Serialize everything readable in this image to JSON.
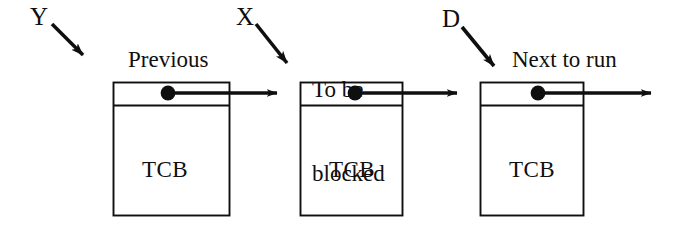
{
  "diagram": {
    "background_color": "#ffffff",
    "stroke_color": "#100f0f",
    "pointer_labels": [
      {
        "id": "y",
        "text": "Y",
        "x": 30,
        "y": 4,
        "arrow": {
          "x1": 52,
          "y1": 24,
          "x2": 90,
          "y2": 62
        }
      },
      {
        "id": "x",
        "text": "X",
        "x": 236,
        "y": 4,
        "arrow": {
          "x1": 256,
          "y1": 24,
          "x2": 293,
          "y2": 72
        }
      },
      {
        "id": "d",
        "text": "D",
        "x": 442,
        "y": 6,
        "arrow": {
          "x1": 462,
          "y1": 27,
          "x2": 500,
          "y2": 74
        }
      }
    ],
    "nodes": [
      {
        "id": "previous",
        "caption": "Previous",
        "caption_lines": [
          "Previous"
        ],
        "caption_x": 128,
        "caption_y": 48,
        "body_label": "TCB",
        "box": {
          "x": 113,
          "y": 82,
          "width": 117,
          "height": 134
        },
        "divider_y": 105,
        "dot": {
          "cx": 168,
          "cy": 93,
          "r": 7
        },
        "link_arrow": {
          "x1": 168,
          "y1": 93,
          "x2": 288,
          "y2": 93
        }
      },
      {
        "id": "to-be-blocked",
        "caption": "To be blocked",
        "caption_lines": [
          "To be",
          "blocked"
        ],
        "caption_x": 312,
        "caption_y": 20,
        "body_label": "TCB",
        "box": {
          "x": 300,
          "y": 82,
          "width": 103,
          "height": 134
        },
        "divider_y": 105,
        "dot": {
          "cx": 355,
          "cy": 93,
          "r": 7
        },
        "link_arrow": {
          "x1": 355,
          "y1": 93,
          "x2": 468,
          "y2": 93
        }
      },
      {
        "id": "next-to-run",
        "caption": "Next to run",
        "caption_lines": [
          "Next to run"
        ],
        "caption_x": 512,
        "caption_y": 48,
        "body_label": "TCB",
        "box": {
          "x": 480,
          "y": 82,
          "width": 104,
          "height": 134
        },
        "divider_y": 105,
        "dot": {
          "cx": 538,
          "cy": 93,
          "r": 7
        },
        "link_arrow": {
          "x1": 538,
          "y1": 93,
          "x2": 662,
          "y2": 93
        }
      }
    ]
  }
}
